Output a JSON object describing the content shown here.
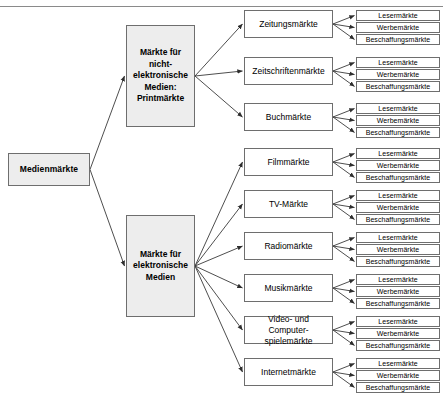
{
  "diagram": {
    "title_residue": "",
    "root": {
      "label": "Medienmärkte",
      "x": 8,
      "y": 153,
      "w": 82,
      "h": 33
    },
    "branches": [
      {
        "name": "print",
        "label": "Märkte für nicht-\nelektronische Medien:\nPrintmärkte",
        "lines": [
          "Märkte für",
          "nicht-",
          "elektronische",
          "Medien:",
          "Printmärkte"
        ],
        "x": 126,
        "y": 25,
        "w": 69,
        "h": 102,
        "children": [
          {
            "label": "Zeitungsmärkte",
            "x": 244,
            "y": 10,
            "w": 89,
            "h": 28,
            "leaves": [
              {
                "label": "Lesermärkte",
                "x": 356,
                "y": 10,
                "w": 84,
                "h": 11
              },
              {
                "label": "Werbemärkte",
                "x": 356,
                "y": 22,
                "w": 84,
                "h": 11
              },
              {
                "label": "Beschaffungsmärkte",
                "x": 356,
                "y": 34,
                "w": 84,
                "h": 11
              }
            ]
          },
          {
            "label": "Zeitschriftenmärkte",
            "x": 244,
            "y": 57,
            "w": 89,
            "h": 28,
            "leaves": [
              {
                "label": "Lesermärkte",
                "x": 356,
                "y": 57,
                "w": 84,
                "h": 11
              },
              {
                "label": "Werbemärkte",
                "x": 356,
                "y": 69,
                "w": 84,
                "h": 11
              },
              {
                "label": "Beschaffungsmärkte",
                "x": 356,
                "y": 81,
                "w": 84,
                "h": 11
              }
            ]
          },
          {
            "label": "Buchmärkte",
            "x": 244,
            "y": 103,
            "w": 89,
            "h": 28,
            "leaves": [
              {
                "label": "Lesermärkte",
                "x": 356,
                "y": 103,
                "w": 84,
                "h": 11
              },
              {
                "label": "Werbemärkte",
                "x": 356,
                "y": 115,
                "w": 84,
                "h": 11
              },
              {
                "label": "Beschaffungsmärkte",
                "x": 356,
                "y": 127,
                "w": 84,
                "h": 11
              }
            ]
          }
        ]
      },
      {
        "name": "electronic",
        "label": "Märkte für elektronische Medien",
        "lines": [
          "Märkte für",
          "elektronische",
          "Medien"
        ],
        "x": 126,
        "y": 215,
        "w": 69,
        "h": 102,
        "children": [
          {
            "label": "Filmmärkte",
            "x": 244,
            "y": 148,
            "w": 89,
            "h": 28,
            "leaves": [
              {
                "label": "Lesermärkte",
                "x": 356,
                "y": 148,
                "w": 84,
                "h": 11
              },
              {
                "label": "Werbemärkte",
                "x": 356,
                "y": 160,
                "w": 84,
                "h": 11
              },
              {
                "label": "Beschaffungsmärkte",
                "x": 356,
                "y": 172,
                "w": 84,
                "h": 11
              }
            ]
          },
          {
            "label": "TV-Märkte",
            "x": 244,
            "y": 190,
            "w": 89,
            "h": 28,
            "leaves": [
              {
                "label": "Lesermärkte",
                "x": 356,
                "y": 190,
                "w": 84,
                "h": 11
              },
              {
                "label": "Werbemärkte",
                "x": 356,
                "y": 202,
                "w": 84,
                "h": 11
              },
              {
                "label": "Beschaffungsmärkte",
                "x": 356,
                "y": 214,
                "w": 84,
                "h": 11
              }
            ]
          },
          {
            "label": "Radiomärkte",
            "x": 244,
            "y": 232,
            "w": 89,
            "h": 28,
            "leaves": [
              {
                "label": "Lesermärkte",
                "x": 356,
                "y": 232,
                "w": 84,
                "h": 11
              },
              {
                "label": "Werbemärkte",
                "x": 356,
                "y": 244,
                "w": 84,
                "h": 11
              },
              {
                "label": "Beschaffungsmärkte",
                "x": 356,
                "y": 256,
                "w": 84,
                "h": 11
              }
            ]
          },
          {
            "label": "Musikmärkte",
            "x": 244,
            "y": 274,
            "w": 89,
            "h": 28,
            "leaves": [
              {
                "label": "Lesermärkte",
                "x": 356,
                "y": 274,
                "w": 84,
                "h": 11
              },
              {
                "label": "Werbemärkte",
                "x": 356,
                "y": 286,
                "w": 84,
                "h": 11
              },
              {
                "label": "Beschaffungsmärkte",
                "x": 356,
                "y": 298,
                "w": 84,
                "h": 11
              }
            ]
          },
          {
            "label": "Video- und Computer-spielemärkte",
            "lines": [
              "Video- und Computer-",
              "spielemärkte"
            ],
            "x": 244,
            "y": 316,
            "w": 89,
            "h": 28,
            "leaves": [
              {
                "label": "Lesermärkte",
                "x": 356,
                "y": 316,
                "w": 84,
                "h": 11
              },
              {
                "label": "Werbemärkte",
                "x": 356,
                "y": 328,
                "w": 84,
                "h": 11
              },
              {
                "label": "Beschaffungsmärkte",
                "x": 356,
                "y": 340,
                "w": 84,
                "h": 11
              }
            ]
          },
          {
            "label": "Internetmärkte",
            "x": 244,
            "y": 358,
            "w": 89,
            "h": 28,
            "leaves": [
              {
                "label": "Lesermärkte",
                "x": 356,
                "y": 358,
                "w": 84,
                "h": 11
              },
              {
                "label": "Werbemärkte",
                "x": 356,
                "y": 370,
                "w": 84,
                "h": 11
              },
              {
                "label": "Beschaffungsmärkte",
                "x": 356,
                "y": 382,
                "w": 84,
                "h": 11
              }
            ]
          }
        ]
      }
    ],
    "colors": {
      "box_fill_shaded": "#ededed",
      "box_fill_plain": "#ffffff",
      "border": "#6e6e6e",
      "connector": "#3a3a3a",
      "rule": "#8a8a8a"
    }
  }
}
